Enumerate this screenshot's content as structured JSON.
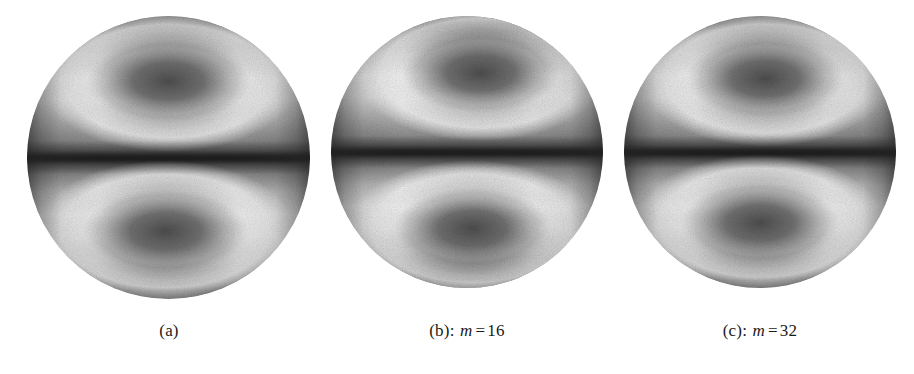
{
  "figure": {
    "background_color": "#ffffff",
    "panel_count": 3
  },
  "panels": [
    {
      "id": "a",
      "caption_label": "(a)",
      "caption_separator": "",
      "caption_variable": "",
      "caption_equals": "",
      "caption_value": "",
      "sphere": {
        "name": "sphere-a",
        "left": 27,
        "top": 16,
        "size": 283,
        "lobe_top_x": "50%",
        "lobe_top_y": "23%",
        "lobe_bottom_x": "49%",
        "lobe_bottom_y": "76%"
      }
    },
    {
      "id": "b",
      "caption_label": "(b)",
      "caption_separator": ":",
      "caption_variable": "m",
      "caption_equals": "=",
      "caption_value": "16",
      "sphere": {
        "name": "sphere-b",
        "left": 331,
        "top": 16,
        "size": 272,
        "lobe_top_x": "55%",
        "lobe_top_y": "21%",
        "lobe_bottom_x": "52%",
        "lobe_bottom_y": "78%"
      }
    },
    {
      "id": "c",
      "caption_label": "(c)",
      "caption_separator": ":",
      "caption_variable": "m",
      "caption_equals": "=",
      "caption_value": "32",
      "sphere": {
        "name": "sphere-c",
        "left": 624,
        "top": 16,
        "size": 272,
        "lobe_top_x": "52%",
        "lobe_top_y": "23%",
        "lobe_bottom_x": "50%",
        "lobe_bottom_y": "76%"
      }
    }
  ],
  "colors": {
    "background": "#ffffff",
    "caption_text": "#1a1a1a",
    "sphere_bright_ring": "#efefef",
    "sphere_lobe_core": "#6a6a6a",
    "sphere_equator_band": "#3b3b3b",
    "sphere_limb": "#505050"
  }
}
